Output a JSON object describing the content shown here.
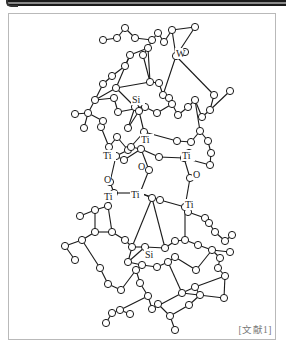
{
  "figure": {
    "type": "ball-and-stick molecular structure",
    "citation": "[文献1]",
    "labels": [
      {
        "text": "W",
        "x": 176,
        "y": 57
      },
      {
        "text": "Si",
        "x": 132,
        "y": 103
      },
      {
        "text": "Ti",
        "x": 141,
        "y": 143
      },
      {
        "text": "Ti",
        "x": 103,
        "y": 159
      },
      {
        "text": "Ti",
        "x": 182,
        "y": 159
      },
      {
        "text": "O",
        "x": 138,
        "y": 170
      },
      {
        "text": "O",
        "x": 104,
        "y": 183
      },
      {
        "text": "O",
        "x": 193,
        "y": 178
      },
      {
        "text": "Ti",
        "x": 131,
        "y": 198
      },
      {
        "text": "Ti",
        "x": 104,
        "y": 200
      },
      {
        "text": "Ti",
        "x": 185,
        "y": 208
      },
      {
        "text": "Si",
        "x": 145,
        "y": 258
      }
    ],
    "atoms": [
      [
        125,
        28
      ],
      [
        117,
        38
      ],
      [
        103,
        40
      ],
      [
        135,
        38
      ],
      [
        152,
        40
      ],
      [
        158,
        33
      ],
      [
        164,
        42
      ],
      [
        172,
        30
      ],
      [
        195,
        27
      ],
      [
        176,
        56
      ],
      [
        185,
        52
      ],
      [
        148,
        48
      ],
      [
        130,
        55
      ],
      [
        143,
        55
      ],
      [
        125,
        66
      ],
      [
        112,
        76
      ],
      [
        103,
        84
      ],
      [
        95,
        100
      ],
      [
        88,
        113
      ],
      [
        75,
        114
      ],
      [
        84,
        128
      ],
      [
        116,
        88
      ],
      [
        150,
        82
      ],
      [
        159,
        83
      ],
      [
        163,
        95
      ],
      [
        169,
        98
      ],
      [
        135,
        107
      ],
      [
        145,
        107
      ],
      [
        118,
        112
      ],
      [
        114,
        98
      ],
      [
        128,
        128
      ],
      [
        139,
        111
      ],
      [
        157,
        113
      ],
      [
        172,
        104
      ],
      [
        178,
        115
      ],
      [
        188,
        107
      ],
      [
        195,
        100
      ],
      [
        202,
        117
      ],
      [
        210,
        110
      ],
      [
        214,
        95
      ],
      [
        230,
        91
      ],
      [
        200,
        131
      ],
      [
        208,
        141
      ],
      [
        211,
        153
      ],
      [
        210,
        165
      ],
      [
        191,
        142
      ],
      [
        177,
        141
      ],
      [
        144,
        132
      ],
      [
        128,
        150
      ],
      [
        131,
        147
      ],
      [
        117,
        137
      ],
      [
        109,
        147
      ],
      [
        101,
        127
      ],
      [
        103,
        121
      ],
      [
        116,
        156
      ],
      [
        124,
        160
      ],
      [
        141,
        149
      ],
      [
        159,
        157
      ],
      [
        184,
        158
      ],
      [
        189,
        153
      ],
      [
        149,
        170
      ],
      [
        110,
        182
      ],
      [
        190,
        178
      ],
      [
        114,
        193
      ],
      [
        140,
        193
      ],
      [
        108,
        206
      ],
      [
        152,
        198
      ],
      [
        160,
        200
      ],
      [
        185,
        207
      ],
      [
        188,
        212
      ],
      [
        95,
        210
      ],
      [
        80,
        216
      ],
      [
        95,
        232
      ],
      [
        112,
        232
      ],
      [
        125,
        240
      ],
      [
        132,
        247
      ],
      [
        145,
        247
      ],
      [
        165,
        248
      ],
      [
        175,
        241
      ],
      [
        185,
        240
      ],
      [
        205,
        218
      ],
      [
        209,
        223
      ],
      [
        215,
        232
      ],
      [
        225,
        241
      ],
      [
        232,
        235
      ],
      [
        198,
        245
      ],
      [
        212,
        250
      ],
      [
        230,
        252
      ],
      [
        220,
        258
      ],
      [
        128,
        262
      ],
      [
        142,
        265
      ],
      [
        157,
        267
      ],
      [
        168,
        262
      ],
      [
        175,
        257
      ],
      [
        196,
        270
      ],
      [
        82,
        240
      ],
      [
        65,
        246
      ],
      [
        75,
        260
      ],
      [
        100,
        268
      ],
      [
        108,
        284
      ],
      [
        121,
        290
      ],
      [
        136,
        270
      ],
      [
        140,
        283
      ],
      [
        148,
        296
      ],
      [
        120,
        310
      ],
      [
        130,
        314
      ],
      [
        112,
        313
      ],
      [
        106,
        323
      ],
      [
        152,
        309
      ],
      [
        158,
        304
      ],
      [
        170,
        316
      ],
      [
        175,
        330
      ],
      [
        182,
        293
      ],
      [
        195,
        287
      ],
      [
        200,
        295
      ],
      [
        189,
        305
      ],
      [
        224,
        298
      ],
      [
        225,
        276
      ],
      [
        218,
        268
      ]
    ],
    "bonds": [
      [
        0,
        1
      ],
      [
        0,
        3
      ],
      [
        1,
        2
      ],
      [
        3,
        4
      ],
      [
        4,
        5
      ],
      [
        5,
        6
      ],
      [
        6,
        7
      ],
      [
        7,
        8
      ],
      [
        7,
        9
      ],
      [
        8,
        9
      ],
      [
        9,
        10
      ],
      [
        4,
        11
      ],
      [
        11,
        12
      ],
      [
        11,
        13
      ],
      [
        12,
        14
      ],
      [
        14,
        15
      ],
      [
        15,
        16
      ],
      [
        16,
        17
      ],
      [
        17,
        18
      ],
      [
        18,
        19
      ],
      [
        18,
        20
      ],
      [
        17,
        21
      ],
      [
        21,
        22
      ],
      [
        22,
        23
      ],
      [
        23,
        24
      ],
      [
        24,
        25
      ],
      [
        11,
        22
      ],
      [
        13,
        22
      ],
      [
        12,
        21
      ],
      [
        21,
        26
      ],
      [
        26,
        27
      ],
      [
        27,
        28
      ],
      [
        28,
        29
      ],
      [
        29,
        17
      ],
      [
        26,
        30
      ],
      [
        30,
        31
      ],
      [
        31,
        27
      ],
      [
        27,
        32
      ],
      [
        32,
        33
      ],
      [
        33,
        34
      ],
      [
        34,
        35
      ],
      [
        35,
        36
      ],
      [
        36,
        37
      ],
      [
        37,
        38
      ],
      [
        38,
        39
      ],
      [
        38,
        40
      ],
      [
        9,
        39
      ],
      [
        9,
        24
      ],
      [
        36,
        41
      ],
      [
        41,
        42
      ],
      [
        42,
        43
      ],
      [
        43,
        44
      ],
      [
        44,
        58
      ],
      [
        41,
        45
      ],
      [
        45,
        46
      ],
      [
        46,
        47
      ],
      [
        47,
        31
      ],
      [
        47,
        48
      ],
      [
        48,
        49
      ],
      [
        48,
        50
      ],
      [
        50,
        51
      ],
      [
        51,
        52
      ],
      [
        52,
        53
      ],
      [
        53,
        18
      ],
      [
        48,
        54
      ],
      [
        54,
        55
      ],
      [
        55,
        56
      ],
      [
        56,
        57
      ],
      [
        57,
        58
      ],
      [
        58,
        59
      ],
      [
        49,
        56
      ],
      [
        56,
        60
      ],
      [
        54,
        61
      ],
      [
        61,
        63
      ],
      [
        58,
        62
      ],
      [
        62,
        68
      ],
      [
        60,
        64
      ],
      [
        64,
        66
      ],
      [
        63,
        65
      ],
      [
        63,
        64
      ],
      [
        64,
        67
      ],
      [
        67,
        68
      ],
      [
        68,
        69
      ],
      [
        65,
        70
      ],
      [
        70,
        71
      ],
      [
        70,
        72
      ],
      [
        72,
        73
      ],
      [
        73,
        74
      ],
      [
        74,
        75
      ],
      [
        75,
        76
      ],
      [
        76,
        77
      ],
      [
        77,
        78
      ],
      [
        78,
        79
      ],
      [
        79,
        68
      ],
      [
        69,
        80
      ],
      [
        80,
        81
      ],
      [
        81,
        82
      ],
      [
        82,
        83
      ],
      [
        83,
        84
      ],
      [
        79,
        85
      ],
      [
        85,
        86
      ],
      [
        86,
        87
      ],
      [
        86,
        88
      ],
      [
        65,
        73
      ],
      [
        66,
        75
      ],
      [
        66,
        77
      ],
      [
        76,
        89
      ],
      [
        89,
        90
      ],
      [
        90,
        91
      ],
      [
        91,
        92
      ],
      [
        92,
        93
      ],
      [
        93,
        94
      ],
      [
        94,
        86
      ],
      [
        72,
        95
      ],
      [
        95,
        96
      ],
      [
        96,
        97
      ],
      [
        95,
        98
      ],
      [
        98,
        99
      ],
      [
        99,
        100
      ],
      [
        100,
        101
      ],
      [
        101,
        102
      ],
      [
        102,
        103
      ],
      [
        103,
        104
      ],
      [
        104,
        105
      ],
      [
        104,
        106
      ],
      [
        106,
        107
      ],
      [
        103,
        108
      ],
      [
        108,
        109
      ],
      [
        109,
        110
      ],
      [
        110,
        111
      ],
      [
        108,
        112
      ],
      [
        112,
        113
      ],
      [
        113,
        114
      ],
      [
        114,
        115
      ],
      [
        115,
        110
      ],
      [
        112,
        116
      ],
      [
        116,
        117
      ],
      [
        117,
        118
      ],
      [
        118,
        88
      ],
      [
        90,
        101
      ],
      [
        75,
        89
      ],
      [
        92,
        112
      ],
      [
        113,
        117
      ]
    ]
  }
}
